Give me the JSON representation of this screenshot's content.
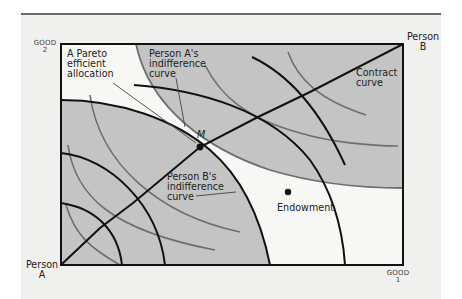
{
  "figure": {
    "axes": {
      "x_label_line1": "GOOD",
      "x_label_line2": "1",
      "y_label_line1": "GOOD",
      "y_label_line2": "2"
    },
    "origins": {
      "person_a_line1": "Person",
      "person_a_line2": "A",
      "person_b_line1": "Person",
      "person_b_line2": "B"
    },
    "annotations": {
      "pareto_line1": "A Pareto",
      "pareto_line2": "efficient",
      "pareto_line3": "allocation",
      "person_a_curve_line1": "Person A's",
      "person_a_curve_line2": "indifference",
      "person_a_curve_line3": "curve",
      "person_b_curve_line1": "Person B's",
      "person_b_curve_line2": "indifference",
      "person_b_curve_line3": "curve",
      "contract_line1": "Contract",
      "contract_line2": "curve",
      "point_m": "M",
      "endowment": "Endowment"
    },
    "colors": {
      "panel_bg": "#f0f0ef",
      "shade": "#c4c4c4",
      "lens": "#f4f4f2",
      "black_curve": "#111111",
      "gray_curve": "#6e6e6e"
    }
  }
}
